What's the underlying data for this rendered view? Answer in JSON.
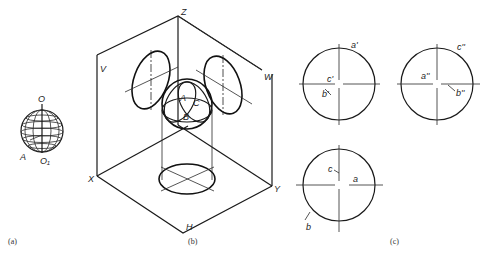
{
  "figure": {
    "panels": [
      {
        "id": "a",
        "caption": "(a)",
        "labels": {
          "top_pole": "O",
          "point": "A",
          "bottom_point": "O₁"
        }
      },
      {
        "id": "b",
        "caption": "(b)",
        "axis_labels": {
          "z": "Z",
          "x": "X",
          "y": "Y"
        },
        "plane_labels": {
          "v": "V",
          "w": "W",
          "h": "H"
        },
        "point_labels": {
          "a": "A",
          "b": "B",
          "c": "C"
        }
      },
      {
        "id": "c",
        "caption": "(c)",
        "views": [
          {
            "name": "front-view",
            "labels": {
              "a": "a'",
              "b": "b'",
              "c": "c'"
            }
          },
          {
            "name": "side-view",
            "labels": {
              "a": "a''",
              "b": "b''",
              "c": "c''"
            }
          },
          {
            "name": "top-view",
            "labels": {
              "a": "a",
              "b": "b",
              "c": "c"
            }
          }
        ]
      }
    ]
  }
}
